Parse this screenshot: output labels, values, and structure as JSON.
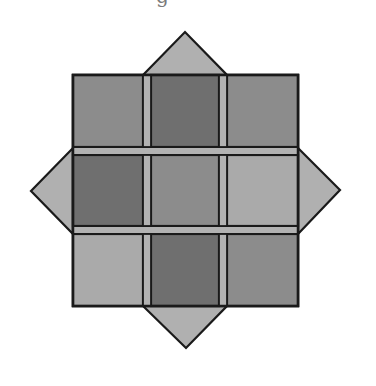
{
  "caption": {
    "visible_fragment": "g"
  },
  "colors": {
    "background": "#ffffff",
    "outline": "#1a1a1a",
    "light": "#b4b4b4",
    "lighter": "#aaaaaa",
    "medium": "#8c8c8c",
    "dark": "#6f6f6f",
    "strip": "#b2b2b2",
    "triangle": "#b0b0b0"
  },
  "figure": {
    "grid": {
      "x": 73,
      "y": 75,
      "width": 225,
      "height": 231,
      "columns": [
        {
          "x0": 73,
          "x1": 143
        },
        {
          "x0": 151,
          "x1": 219
        },
        {
          "x0": 227,
          "x1": 298
        }
      ],
      "rows": [
        {
          "y0": 75,
          "y1": 147
        },
        {
          "y0": 155,
          "y1": 226
        },
        {
          "y0": 234,
          "y1": 306
        }
      ],
      "vertical_strips": [
        {
          "x0": 143,
          "x1": 151
        },
        {
          "x0": 219,
          "x1": 227
        }
      ],
      "horizontal_strips": [
        {
          "y0": 147,
          "y1": 155
        },
        {
          "y0": 226,
          "y1": 234
        }
      ],
      "cells": [
        [
          "medium",
          "dark",
          "medium"
        ],
        [
          "dark",
          "medium",
          "lighter"
        ],
        [
          "lighter",
          "dark",
          "medium"
        ]
      ]
    },
    "triangles": [
      {
        "name": "top",
        "points": "143,75 185,32 227,75"
      },
      {
        "name": "bottom",
        "points": "143,306 186,348 227,306"
      },
      {
        "name": "left",
        "points": "73,148 31,191 73,234"
      },
      {
        "name": "right",
        "points": "298,148 340,190 298,234"
      }
    ]
  }
}
